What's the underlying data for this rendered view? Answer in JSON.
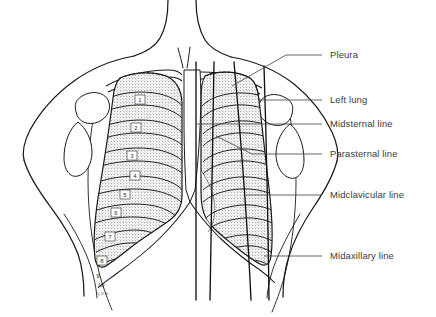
{
  "figure": {
    "background_color": "#ffffff",
    "ink_color": "#1a1a1a",
    "label_color": "#3a3a3a",
    "lung_shading_color": "#b9b9b9",
    "leader_color": "#4a4a4a",
    "signature": "A.V.S."
  },
  "labels": [
    {
      "id": "pleura",
      "text": "Pleura",
      "x": 330,
      "y": 58,
      "leader_x1": 322,
      "leader_y1": 55,
      "leader_x2": 286,
      "leader_y2": 55,
      "target_x": 232,
      "target_y": 86
    },
    {
      "id": "left-lung",
      "text": "Left lung",
      "x": 330,
      "y": 103,
      "leader_x1": 322,
      "leader_y1": 100,
      "leader_x2": 258,
      "leader_y2": 100,
      "target_x": 246,
      "target_y": 101
    },
    {
      "id": "midsternal-line",
      "text": "Midsternal line",
      "x": 330,
      "y": 127,
      "leader_x1": 322,
      "leader_y1": 124,
      "leader_x2": 196,
      "leader_y2": 124,
      "target_x": 196,
      "target_y": 124
    },
    {
      "id": "parasternal-line",
      "text": "Parasternal line",
      "x": 330,
      "y": 157,
      "leader_x1": 322,
      "leader_y1": 154,
      "leader_x2": 252,
      "leader_y2": 154,
      "target_x": 216,
      "target_y": 154
    },
    {
      "id": "midclavicular-line",
      "text": "Midclavicular line",
      "x": 330,
      "y": 198,
      "leader_x1": 322,
      "leader_y1": 195,
      "leader_x2": 252,
      "leader_y2": 195,
      "target_x": 252,
      "target_y": 195
    },
    {
      "id": "midaxillary-line",
      "text": "Midaxillary line",
      "x": 330,
      "y": 259,
      "leader_x1": 322,
      "leader_y1": 256,
      "leader_x2": 262,
      "leader_y2": 256,
      "target_x": 262,
      "target_y": 256
    }
  ],
  "rib_numbers": [
    {
      "n": "1",
      "x": 141,
      "y": 101
    },
    {
      "n": "2",
      "x": 137,
      "y": 129
    },
    {
      "n": "3",
      "x": 132,
      "y": 157
    },
    {
      "n": "4",
      "x": 135,
      "y": 177
    },
    {
      "n": "5",
      "x": 125,
      "y": 196
    },
    {
      "n": "6",
      "x": 116,
      "y": 214
    },
    {
      "n": "7",
      "x": 110,
      "y": 238
    },
    {
      "n": "8",
      "x": 102,
      "y": 262
    },
    {
      "n": "9",
      "x": 98,
      "y": 276
    },
    {
      "n": "10",
      "x": 101,
      "y": 285
    }
  ],
  "vertical_reference_lines": [
    {
      "id": "midsternal",
      "x_top": 196,
      "x_bottom": 196
    },
    {
      "id": "parasternal",
      "x_top": 214,
      "x_bottom": 210
    },
    {
      "id": "midclavicular",
      "x_top": 238,
      "x_bottom": 250
    },
    {
      "id": "midaxillary",
      "x_top": 266,
      "x_bottom": 268
    }
  ]
}
